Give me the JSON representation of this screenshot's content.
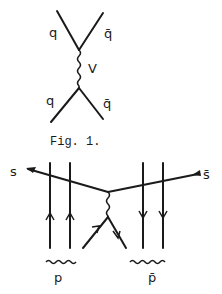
{
  "figure1": {
    "caption": "Fig. 1.",
    "labels": {
      "top_left": "q",
      "top_right": "q̄",
      "propagator": "V",
      "bottom_left": "q",
      "bottom_right": "q̄"
    }
  },
  "figure2": {
    "labels": {
      "s": "s",
      "sbar": "s̄",
      "p": "p",
      "pbar": "p̄"
    }
  }
}
